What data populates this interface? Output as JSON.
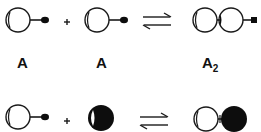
{
  "diagram": {
    "type": "dimerization-equilibrium",
    "row1": {
      "reactant1_label": "A",
      "reactant2_label": "A",
      "operator": "+",
      "equilibrium": "⇌",
      "product_label_main": "A",
      "product_label_sub": "2"
    },
    "row2": {
      "operator": "+",
      "equilibrium": "⇌"
    },
    "colors": {
      "stroke": "#1a1a1a",
      "fill_dark": "#0d0d0d",
      "background": "#ffffff"
    }
  }
}
